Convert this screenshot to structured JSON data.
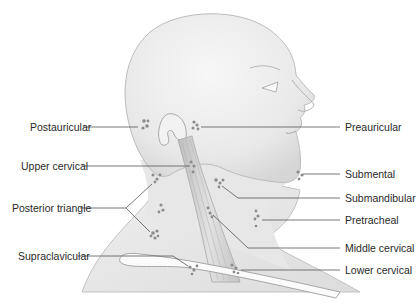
{
  "diagram": {
    "colors": {
      "skin": "#ececec",
      "skin_shadow": "#d4d4d4",
      "outline": "#b9b9b9",
      "muscle": "#cfcfcf",
      "node": "#8e8e8e",
      "leader": "#555555",
      "text": "#2a2a2a"
    },
    "labels_left": [
      {
        "id": "postauricular",
        "text": "Postauricular",
        "x": 30,
        "y": 122
      },
      {
        "id": "upper-cervical",
        "text": "Upper cervical",
        "x": 21,
        "y": 161
      },
      {
        "id": "posterior-triangle",
        "text": "Posterior triangle",
        "x": 12,
        "y": 203
      },
      {
        "id": "supraclavicular",
        "text": "Supraclavicular",
        "x": 18,
        "y": 251
      }
    ],
    "labels_right": [
      {
        "id": "preauricular",
        "text": "Preauricular",
        "x": 345,
        "y": 122
      },
      {
        "id": "submental",
        "text": "Submental",
        "x": 345,
        "y": 169
      },
      {
        "id": "submandibular",
        "text": "Submandibular",
        "x": 345,
        "y": 193
      },
      {
        "id": "pretracheal",
        "text": "Pretracheal",
        "x": 345,
        "y": 215
      },
      {
        "id": "middle-cervical",
        "text": "Middle cervical",
        "x": 345,
        "y": 243
      },
      {
        "id": "lower-cervical",
        "text": "Lower cervical",
        "x": 345,
        "y": 265
      }
    ]
  }
}
